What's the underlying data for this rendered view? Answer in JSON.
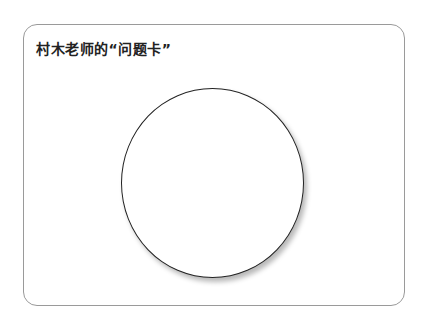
{
  "card": {
    "title": "村木老师的“问题卡”"
  },
  "colors": {
    "border": "#9a9a9a",
    "circle_stroke": "#222222",
    "background": "#ffffff"
  }
}
